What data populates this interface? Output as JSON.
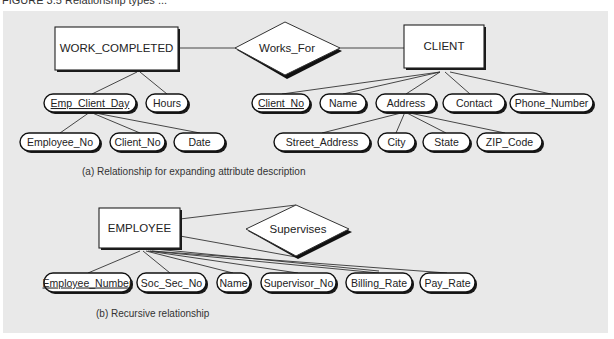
{
  "header": {
    "text": "FIGURE 3.5   Relationship types ..."
  },
  "figure": {
    "part_a": {
      "caption": "(a)  Relationship for expanding attribute description",
      "entities": [
        {
          "id": "work_completed",
          "label": "WORK_COMPLETED"
        },
        {
          "id": "client",
          "label": "CLIENT"
        }
      ],
      "relationship": {
        "label": "Works_For"
      },
      "work_completed_attributes": [
        {
          "label": "Emp_Client_Day",
          "key": true
        },
        {
          "label": "Hours",
          "key": false
        }
      ],
      "emp_client_day_components": [
        {
          "label": "Employee_No"
        },
        {
          "label": "Client_No"
        },
        {
          "label": "Date"
        }
      ],
      "client_attributes": [
        {
          "label": "Client_No",
          "key": true
        },
        {
          "label": "Name",
          "key": false
        },
        {
          "label": "Address",
          "key": false
        },
        {
          "label": "Contact",
          "key": false
        },
        {
          "label": "Phone_Number",
          "key": false
        }
      ],
      "address_components": [
        {
          "label": "Street_Address"
        },
        {
          "label": "City"
        },
        {
          "label": "State"
        },
        {
          "label": "ZIP_Code"
        }
      ]
    },
    "part_b": {
      "caption": "(b)  Recursive relationship",
      "entity": {
        "label": "EMPLOYEE"
      },
      "relationship": {
        "label": "Supervises"
      },
      "attributes": [
        {
          "label": "Employee_Number",
          "key": true
        },
        {
          "label": "Soc_Sec_No",
          "key": false
        },
        {
          "label": "Name",
          "key": false
        },
        {
          "label": "Supervisor_No",
          "key": false
        },
        {
          "label": "Billing_Rate",
          "key": false
        },
        {
          "label": "Pay_Rate",
          "key": false
        }
      ]
    }
  },
  "colors": {
    "panel": "#e9e9e9",
    "stroke": "#222222",
    "shadow": "#1a1a1a"
  }
}
